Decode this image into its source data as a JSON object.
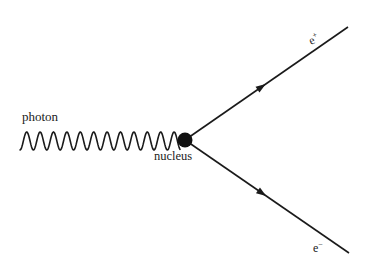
{
  "diagram": {
    "type": "feynman-pair-production",
    "colors": {
      "line": "#1a1a1a",
      "nucleus": "#111111",
      "background": "#ffffff"
    },
    "photon": {
      "label": "photon",
      "wave": {
        "x_start": 20,
        "x_end": 180,
        "y_center": 141,
        "amplitude": 9,
        "wavelength": 13.4
      }
    },
    "nucleus": {
      "label": "nucleus",
      "cx": 185,
      "cy": 140,
      "r": 7.5
    },
    "particles": [
      {
        "name": "positron",
        "label": "e",
        "charge": "+",
        "x1": 185,
        "y1": 140,
        "x2": 348,
        "y2": 27,
        "arrow_at": 0.47
      },
      {
        "name": "electron",
        "label": "e",
        "charge": "−",
        "x1": 185,
        "y1": 140,
        "x2": 349,
        "y2": 253,
        "arrow_at": 0.47
      }
    ]
  }
}
